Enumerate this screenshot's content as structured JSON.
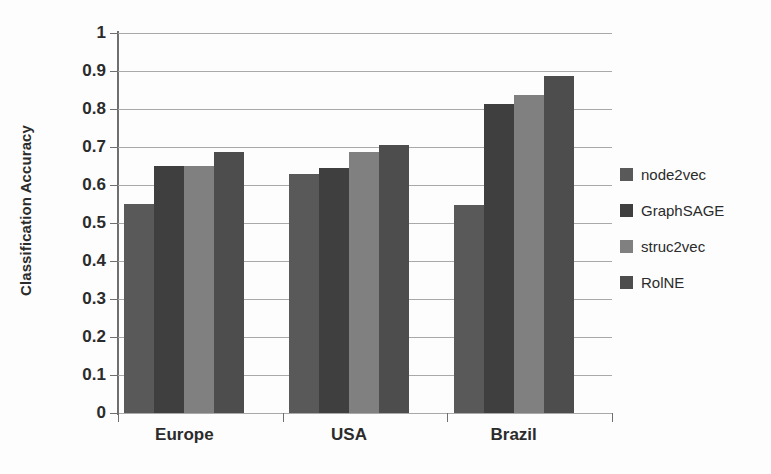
{
  "chart_data": {
    "type": "bar",
    "title": "",
    "xlabel": "",
    "ylabel": "Classification Accuracy",
    "ylim": [
      0,
      1
    ],
    "ytick_step": 0.1,
    "ytick_labels": [
      "1",
      "0.9",
      "0.8",
      "0.7",
      "0.6",
      "0.5",
      "0.4",
      "0.3",
      "0.2",
      "0.1",
      "0"
    ],
    "grid": true,
    "legend_position": "right",
    "categories": [
      "Europe",
      "USA",
      "Brazil"
    ],
    "series": [
      {
        "name": "node2vec",
        "color": "#595959",
        "values": [
          0.55,
          0.63,
          0.548
        ]
      },
      {
        "name": "GraphSAGE",
        "color": "#3f3f3f",
        "values": [
          0.65,
          0.645,
          0.813
        ]
      },
      {
        "name": "struc2vec",
        "color": "#808080",
        "values": [
          0.65,
          0.688,
          0.838
        ]
      },
      {
        "name": "RolNE",
        "color": "#4d4d4d",
        "values": [
          0.686,
          0.705,
          0.887
        ]
      }
    ]
  },
  "axis": {
    "y_title": "Classification Accuracy"
  },
  "legend": {
    "items": [
      {
        "label": "node2vec",
        "color": "#595959"
      },
      {
        "label": "GraphSAGE",
        "color": "#3f3f3f"
      },
      {
        "label": "struc2vec",
        "color": "#808080"
      },
      {
        "label": "RolNE",
        "color": "#4d4d4d"
      }
    ]
  }
}
